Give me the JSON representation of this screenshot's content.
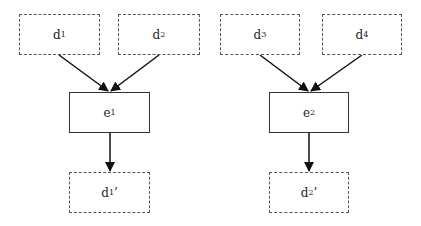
{
  "diagram": {
    "groups": [
      {
        "inputs": [
          {
            "id": "d1",
            "base": "d",
            "sub": "1",
            "prime": ""
          },
          {
            "id": "d2",
            "base": "d",
            "sub": "2",
            "prime": ""
          }
        ],
        "process": {
          "id": "e1",
          "base": "e",
          "sub": "1",
          "prime": ""
        },
        "output": {
          "id": "d1p",
          "base": "d",
          "sub": "1",
          "prime": "’"
        }
      },
      {
        "inputs": [
          {
            "id": "d3",
            "base": "d",
            "sub": "3",
            "prime": ""
          },
          {
            "id": "d4",
            "base": "d",
            "sub": "4",
            "prime": ""
          }
        ],
        "process": {
          "id": "e2",
          "base": "e",
          "sub": "2",
          "prime": ""
        },
        "output": {
          "id": "d2p",
          "base": "d",
          "sub": "2",
          "prime": "’"
        }
      }
    ],
    "edges": [
      {
        "from": "d1",
        "to": "e1"
      },
      {
        "from": "d2",
        "to": "e1"
      },
      {
        "from": "e1",
        "to": "d1p"
      },
      {
        "from": "d3",
        "to": "e2"
      },
      {
        "from": "d4",
        "to": "e2"
      },
      {
        "from": "e2",
        "to": "d2p"
      }
    ],
    "colors": {
      "line": "#111111",
      "dashed_border": "#555555",
      "solid_border": "#333333"
    }
  }
}
